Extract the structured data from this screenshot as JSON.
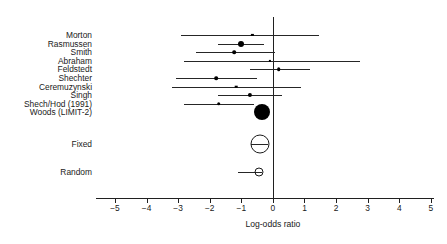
{
  "chart_data": {
    "type": "scatter",
    "subtype": "forest-plot",
    "title": "",
    "xlabel": "Log-odds ratio",
    "ylabel": "",
    "xlim": [
      -5.6,
      5.1
    ],
    "xticks": [
      -5,
      -4,
      -3,
      -2,
      -1,
      0,
      1,
      2,
      3,
      4,
      5
    ],
    "xticklabels": [
      "−5",
      "−4",
      "−3",
      "−2",
      "−1",
      "0",
      "1",
      "2",
      "3",
      "4",
      "5"
    ],
    "grid": false,
    "legend": "none",
    "reference_line": 0,
    "studies": [
      {
        "label": "Morton",
        "estimate": -0.65,
        "ci_low": -2.9,
        "ci_high": 1.46,
        "marker": "square",
        "size": 2.2
      },
      {
        "label": "Rasmussen",
        "estimate": -1.02,
        "ci_low": -1.75,
        "ci_high": -0.28,
        "marker": "circle",
        "size": 6.0
      },
      {
        "label": "Smith",
        "estimate": -1.22,
        "ci_low": -2.45,
        "ci_high": 0.08,
        "marker": "circle",
        "size": 3.6
      },
      {
        "label": "Abraham",
        "estimate": -0.1,
        "ci_low": -2.8,
        "ci_high": 2.75,
        "marker": "square",
        "size": 2.2
      },
      {
        "label": "Feldstedt",
        "estimate": 0.19,
        "ci_low": -0.74,
        "ci_high": 1.18,
        "marker": "circle",
        "size": 3.6
      },
      {
        "label": "Shechter",
        "estimate": -1.8,
        "ci_low": -3.08,
        "ci_high": -0.5,
        "marker": "circle",
        "size": 3.6
      },
      {
        "label": "Ceremuzynski",
        "estimate": -1.16,
        "ci_low": -3.18,
        "ci_high": 0.88,
        "marker": "square",
        "size": 2.6
      },
      {
        "label": "Singh",
        "estimate": -0.73,
        "ci_low": -1.73,
        "ci_high": 0.3,
        "marker": "circle",
        "size": 4.2
      },
      {
        "label": "Shech/Hod (1991)",
        "estimate": -1.71,
        "ci_low": -2.8,
        "ci_high": -0.6,
        "marker": "circle",
        "size": 3.6
      },
      {
        "label": "Woods (LIMIT-2)",
        "estimate": -0.35,
        "ci_low": -0.46,
        "ci_high": -0.24,
        "marker": "bigcircle",
        "size": 16.0
      }
    ],
    "summaries": [
      {
        "label": "Fixed",
        "estimate": -0.42,
        "ci_low": -0.68,
        "ci_high": -0.16,
        "marker": "open",
        "size": 19.0
      },
      {
        "label": "Random",
        "estimate": -0.44,
        "ci_low": -1.12,
        "ci_high": -0.33,
        "marker": "open",
        "size": 9.0
      }
    ]
  },
  "axis": {
    "xlabel": "Log-odds ratio"
  }
}
